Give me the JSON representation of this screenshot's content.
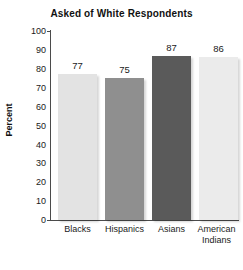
{
  "chart_data": {
    "type": "bar",
    "title": "Asked of White Respondents",
    "xlabel": "",
    "ylabel": "Percent",
    "categories": [
      "Blacks",
      "Hispanics",
      "Asians",
      "American Indians"
    ],
    "category_lines": [
      [
        "Blacks"
      ],
      [
        "Hispanics"
      ],
      [
        "Asians"
      ],
      [
        "American",
        "Indians"
      ]
    ],
    "values": [
      77,
      75,
      87,
      86
    ],
    "value_labels": [
      "77",
      "75",
      "87",
      "86"
    ],
    "bar_colors": [
      "#e3e3e3",
      "#8f8f8f",
      "#5a5a5a",
      "#ebebeb"
    ],
    "ylim": [
      0,
      100
    ],
    "ytick_step": 10,
    "ytick_labels": [
      "100",
      "90",
      "80",
      "70",
      "60",
      "50",
      "40",
      "30",
      "20",
      "10",
      "0"
    ],
    "ytick_values": [
      100,
      90,
      80,
      70,
      60,
      50,
      40,
      30,
      20,
      10,
      0
    ],
    "grid": false,
    "legend": false,
    "axis_color": "#4b4b4b",
    "background": "#ffffff"
  }
}
